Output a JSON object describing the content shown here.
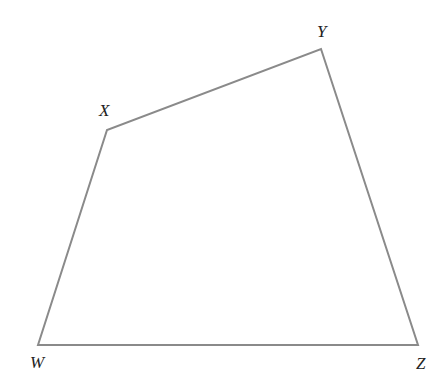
{
  "diagram": {
    "type": "quadrilateral",
    "stroke_color": "#8a8a8a",
    "label_color": "#222222",
    "vertices": [
      {
        "name": "W",
        "x": 38,
        "y": 345,
        "label_x": 30,
        "label_y": 368
      },
      {
        "name": "X",
        "x": 107,
        "y": 130,
        "label_x": 99,
        "label_y": 116
      },
      {
        "name": "Y",
        "x": 321,
        "y": 49,
        "label_x": 317,
        "label_y": 37
      },
      {
        "name": "Z",
        "x": 418,
        "y": 345,
        "label_x": 416,
        "label_y": 369
      }
    ],
    "edges": [
      [
        "W",
        "X"
      ],
      [
        "X",
        "Y"
      ],
      [
        "Y",
        "Z"
      ],
      [
        "Z",
        "W"
      ]
    ]
  }
}
